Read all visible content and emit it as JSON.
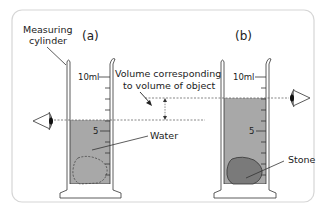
{
  "diagram": {
    "colors": {
      "panel_border": "#d6d6d6",
      "water": "#a8a8a8",
      "stone": "#7a7a7a",
      "glass": "#ffffff",
      "line": "#333333",
      "dashed": "#555555"
    },
    "panel_a": {
      "label": "(a)",
      "cylinder_label_line1": "Measuring",
      "cylinder_label_line2": "cylinder",
      "tick_top": "10ml",
      "tick_mid": "5",
      "water_label": "Water",
      "object": "dashed outline of object (not yet added)"
    },
    "panel_b": {
      "label": "(b)",
      "tick_top": "10ml",
      "tick_mid": "5",
      "stone_label": "Stone"
    },
    "annotation": {
      "line1": "Volume corresponding",
      "line2": "to volume of object"
    },
    "icons": [
      "eye-icon-left",
      "eye-icon-right",
      "double-arrow-icon"
    ]
  }
}
